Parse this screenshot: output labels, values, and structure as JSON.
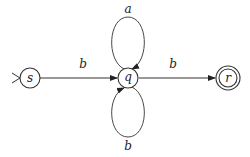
{
  "diagram": {
    "type": "finite-automaton",
    "nodes": [
      {
        "id": "s",
        "label": "s",
        "start": true,
        "accepting": false
      },
      {
        "id": "q",
        "label": "q",
        "start": false,
        "accepting": false
      },
      {
        "id": "r",
        "label": "r",
        "start": false,
        "accepting": true
      }
    ],
    "edges": [
      {
        "from": "s",
        "to": "q",
        "label": "b"
      },
      {
        "from": "q",
        "to": "q",
        "label": "a",
        "position": "top-loop"
      },
      {
        "from": "q",
        "to": "q",
        "label": "b",
        "position": "bottom-loop"
      },
      {
        "from": "q",
        "to": "r",
        "label": "b"
      }
    ],
    "colors": {
      "stroke": "#333333",
      "background": "#ffffff"
    }
  }
}
